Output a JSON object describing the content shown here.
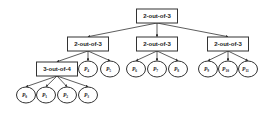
{
  "diagram": {
    "type": "fault-tree",
    "colors": {
      "stroke": "#333333",
      "fill": "#ffffff",
      "text": "#222222"
    },
    "nodes": [
      {
        "id": "root",
        "kind": "gate",
        "label": "2-out-of-3",
        "x": 157,
        "y": 16
      },
      {
        "id": "g1",
        "kind": "gate",
        "label": "2-out-of-3",
        "x": 88,
        "y": 44,
        "parent": "root"
      },
      {
        "id": "g2",
        "kind": "gate",
        "label": "2-out-of-3",
        "x": 157,
        "y": 44,
        "parent": "root"
      },
      {
        "id": "g3",
        "kind": "gate",
        "label": "2-out-of-3",
        "x": 228,
        "y": 44,
        "parent": "root"
      },
      {
        "id": "g4",
        "kind": "gate",
        "label": "3-out-of-4",
        "x": 57,
        "y": 69,
        "parent": "g1"
      },
      {
        "id": "P4",
        "kind": "leaf",
        "base": "P",
        "sub": "4",
        "x": 88,
        "y": 69,
        "parent": "g1"
      },
      {
        "id": "P5",
        "kind": "leaf",
        "base": "P",
        "sub": "5",
        "x": 110,
        "y": 69,
        "parent": "g1"
      },
      {
        "id": "P6",
        "kind": "leaf",
        "base": "P",
        "sub": "6",
        "x": 136,
        "y": 69,
        "parent": "g2"
      },
      {
        "id": "P7",
        "kind": "leaf",
        "base": "P",
        "sub": "7",
        "x": 157,
        "y": 69,
        "parent": "g2"
      },
      {
        "id": "P8",
        "kind": "leaf",
        "base": "P",
        "sub": "8",
        "x": 178,
        "y": 69,
        "parent": "g2"
      },
      {
        "id": "P9",
        "kind": "leaf",
        "base": "P",
        "sub": "9",
        "x": 208,
        "y": 69,
        "parent": "g3"
      },
      {
        "id": "P10",
        "kind": "leaf",
        "base": "P",
        "sub": "10",
        "x": 228,
        "y": 69,
        "parent": "g3"
      },
      {
        "id": "P11",
        "kind": "leaf",
        "base": "P",
        "sub": "11",
        "x": 248,
        "y": 69,
        "parent": "g3"
      },
      {
        "id": "P0",
        "kind": "leaf",
        "base": "P",
        "sub": "0",
        "x": 26,
        "y": 95,
        "parent": "g4"
      },
      {
        "id": "P1",
        "kind": "leaf",
        "base": "P",
        "sub": "1",
        "x": 46,
        "y": 95,
        "parent": "g4"
      },
      {
        "id": "P2",
        "kind": "leaf",
        "base": "P",
        "sub": "2",
        "x": 67,
        "y": 95,
        "parent": "g4"
      },
      {
        "id": "P3",
        "kind": "leaf",
        "base": "P",
        "sub": "3",
        "x": 88,
        "y": 95,
        "parent": "g4"
      }
    ]
  }
}
